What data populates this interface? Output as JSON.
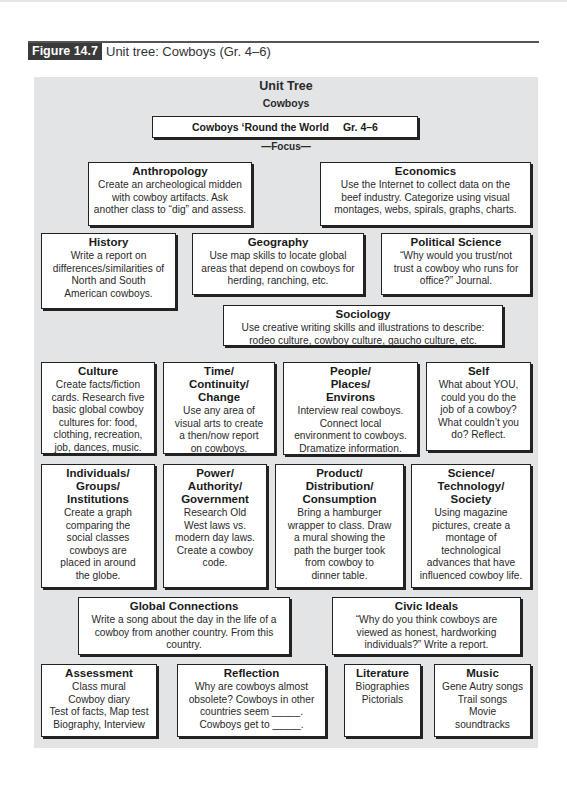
{
  "figure": {
    "label": "Figure 14.7",
    "caption": "Unit tree: Cowboys (Gr. 4–6)"
  },
  "tree": {
    "heading": "Unit Tree",
    "subheading": "Cowboys",
    "unit_title": "Cowboys ‘Round the World",
    "grade": "Gr. 4–6",
    "focus_label": "—Focus—",
    "boxes": {
      "anthropology": {
        "title": "Anthropology",
        "text": "Create an archeological midden\nwith cowboy artifacts. Ask\nanother class to “dig” and assess."
      },
      "economics": {
        "title": "Economics",
        "text": "Use the Internet to collect data on the\nbeef industry. Categorize using visual\nmontages, webs, spirals, graphs, charts."
      },
      "history": {
        "title": "History",
        "text": "Write a report on\ndifferences/similarities of\nNorth and South\nAmerican cowboys."
      },
      "geography": {
        "title": "Geography",
        "text": "Use map skills to locate global\nareas that depend on cowboys for\nherding, ranching, etc."
      },
      "political_science": {
        "title": "Political Science",
        "text": "“Why would you trust/not\ntrust a cowboy who runs for\noffice?” Journal."
      },
      "sociology": {
        "title": "Sociology",
        "text": "Use creative writing skills and illustrations to describe:\nrodeo culture, cowboy culture, gaucho culture, etc."
      },
      "culture": {
        "title": "Culture",
        "text": "Create facts/fiction\ncards. Research five\nbasic global cowboy\ncultures for: food,\nclothing, recreation,\njob, dances, music."
      },
      "time": {
        "title": "Time/\nContinuity/\nChange",
        "text": "Use any area of\nvisual arts to create\na then/now report\non cowboys."
      },
      "people": {
        "title": "People/\nPlaces/\nEnvirons",
        "text": "Interview real cowboys.\nConnect local\nenvironment to cowboys.\nDramatize information."
      },
      "self": {
        "title": "Self",
        "text": "What about YOU,\ncould you do the\njob of a cowboy?\nWhat couldn’t you\ndo? Reflect."
      },
      "individuals": {
        "title": "Individuals/\nGroups/\nInstitutions",
        "text": "Create a graph\ncomparing the\nsocial classes\ncowboys are\nplaced in around\nthe globe."
      },
      "power": {
        "title": "Power/\nAuthority/\nGovernment",
        "text": "Research Old\nWest laws vs.\nmodern day laws.\nCreate a cowboy\ncode."
      },
      "product": {
        "title": "Product/\nDistribution/\nConsumption",
        "text": "Bring a hamburger\nwrapper to class. Draw\na mural showing the\npath the burger took\nfrom cowboy to\ndinner table."
      },
      "science": {
        "title": "Science/\nTechnology/\nSociety",
        "text": "Using magazine\npictures, create a\nmontage of\ntechnological\nadvances that have\ninfluenced cowboy life."
      },
      "global": {
        "title": "Global Connections",
        "text": "Write a song about the day in the life of a\ncowboy from another country. From this\ncountry."
      },
      "civic": {
        "title": "Civic Ideals",
        "text": "“Why do you think cowboys are\nviewed as honest, hardworking\nindividuals?” Write a report."
      },
      "assessment": {
        "title": "Assessment",
        "text": "Class mural\nCowboy diary\nTest of facts, Map test\nBiography, Interview"
      },
      "reflection": {
        "title": "Reflection",
        "text": "Why are cowboys almost\nobsolete? Cowboys in other\ncountries seem _____.\nCowboys get to _____."
      },
      "literature": {
        "title": "Literature",
        "text": "Biographies\nPictorials"
      },
      "music": {
        "title": "Music",
        "text": "Gene Autry songs\nTrail songs\nMovie\nsoundtracks"
      }
    }
  }
}
